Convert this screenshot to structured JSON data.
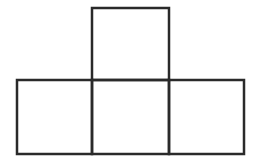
{
  "diagram": {
    "stroke_color": "#2a2a2a",
    "background_color": "#ffffff",
    "squares": [
      {
        "name": "top-square",
        "x": 92,
        "y": 8,
        "w": 77,
        "h": 72
      },
      {
        "name": "bottom-left-square",
        "x": 17,
        "y": 80,
        "w": 75,
        "h": 74
      },
      {
        "name": "bottom-middle-square",
        "x": 92,
        "y": 80,
        "w": 77,
        "h": 74
      },
      {
        "name": "bottom-right-square",
        "x": 169,
        "y": 80,
        "w": 75,
        "h": 74
      }
    ]
  }
}
